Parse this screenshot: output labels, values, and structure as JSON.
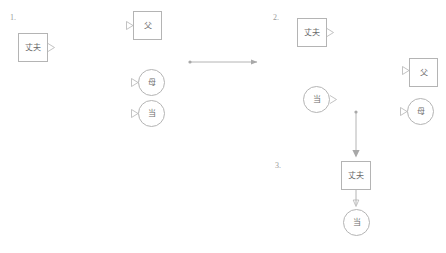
{
  "canvas": {
    "width": 446,
    "height": 253,
    "background": "#ffffff",
    "stroke_color": "#b4b4b4",
    "text_color": "#6b6b6b",
    "number_color": "#9a9a9a"
  },
  "sections": [
    {
      "id": "section-1",
      "label": "1.",
      "x": 10,
      "y": 14
    },
    {
      "id": "section-2",
      "label": "2.",
      "x": 273,
      "y": 14
    },
    {
      "id": "section-3",
      "label": "3.",
      "x": 275,
      "y": 162
    }
  ],
  "nodes": [
    {
      "id": "n1-husband",
      "section": "1.",
      "shape": "rect",
      "label": "丈夫",
      "x": 18,
      "y": 33,
      "w": 30,
      "h": 29,
      "out_port": "right",
      "in_port": false
    },
    {
      "id": "n1-father",
      "section": "1.",
      "shape": "rect",
      "label": "父",
      "x": 133,
      "y": 11,
      "w": 29,
      "h": 29,
      "out_port": false,
      "in_port": "left"
    },
    {
      "id": "n1-mother",
      "section": "1.",
      "shape": "circle",
      "label": "母",
      "x": 138,
      "y": 69,
      "w": 27,
      "h": 27,
      "out_port": false,
      "in_port": "left"
    },
    {
      "id": "n1-dang",
      "section": "1.",
      "shape": "circle",
      "label": "当",
      "x": 138,
      "y": 100,
      "w": 27,
      "h": 27,
      "out_port": false,
      "in_port": "left"
    },
    {
      "id": "n2-husband",
      "section": "2.",
      "shape": "rect",
      "label": "丈夫",
      "x": 297,
      "y": 18,
      "w": 30,
      "h": 29,
      "out_port": "right",
      "in_port": false
    },
    {
      "id": "n2-dang",
      "section": "2.",
      "shape": "circle",
      "label": "当",
      "x": 303,
      "y": 86,
      "w": 27,
      "h": 27,
      "out_port": "right",
      "in_port": false
    },
    {
      "id": "n2-father",
      "section": "2.",
      "shape": "rect",
      "label": "父",
      "x": 409,
      "y": 58,
      "w": 29,
      "h": 29,
      "out_port": false,
      "in_port": "left"
    },
    {
      "id": "n2-mother",
      "section": "2.",
      "shape": "circle",
      "label": "母",
      "x": 407,
      "y": 98,
      "w": 27,
      "h": 27,
      "out_port": false,
      "in_port": "left"
    },
    {
      "id": "n3-husband",
      "section": "3.",
      "shape": "rect",
      "label": "丈夫",
      "x": 341,
      "y": 161,
      "w": 30,
      "h": 29,
      "out_port": false,
      "in_port": "top"
    },
    {
      "id": "n3-dang",
      "section": "3.",
      "shape": "circle",
      "label": "当",
      "x": 343,
      "y": 209,
      "w": 27,
      "h": 27,
      "out_port": false,
      "in_port": "top"
    }
  ],
  "connectors": [
    {
      "id": "connector-horizontal",
      "orientation": "horizontal",
      "direction": "right",
      "x1": 190,
      "y1": 62,
      "x2": 258,
      "y2": 62
    },
    {
      "id": "connector-vertical",
      "orientation": "vertical",
      "direction": "down",
      "x1": 356,
      "y1": 112,
      "x2": 356,
      "y2": 157
    },
    {
      "id": "connector-box-to-circle",
      "orientation": "vertical",
      "direction": "down",
      "x1": 356,
      "y1": 190,
      "x2": 356,
      "y2": 207
    }
  ]
}
